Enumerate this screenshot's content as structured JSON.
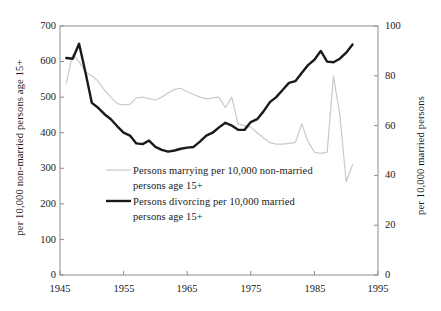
{
  "chart_data": {
    "type": "line",
    "title": "",
    "xlabel": "",
    "ylabel": "per 10,000 non-married persons age 15+",
    "ylabel_right": "per 10,000 married persons",
    "xlim": [
      1945,
      1995
    ],
    "ylim": [
      0,
      700
    ],
    "ylim_right": [
      0,
      100
    ],
    "xticks": [
      1945,
      1955,
      1965,
      1975,
      1985,
      1995
    ],
    "yticks_left": [
      0,
      100,
      200,
      300,
      400,
      500,
      600,
      700
    ],
    "yticks_right": [
      0,
      20,
      40,
      60,
      80,
      100
    ],
    "grid": false,
    "legend_position": "inside-center-left",
    "series": [
      {
        "name": "Persons marrying per 10,000 non-married persons age 15+",
        "axis": "left",
        "color": "#c9c9c9",
        "width": 1.2,
        "x": [
          1946,
          1947,
          1948,
          1949,
          1950,
          1951,
          1952,
          1953,
          1954,
          1955,
          1956,
          1957,
          1958,
          1959,
          1960,
          1961,
          1962,
          1963,
          1964,
          1965,
          1966,
          1967,
          1968,
          1969,
          1970,
          1971,
          1972,
          1973,
          1974,
          1975,
          1976,
          1977,
          1978,
          1979,
          1980,
          1981,
          1982,
          1983,
          1984,
          1985,
          1986,
          1987,
          1988,
          1989,
          1990,
          1991
        ],
        "values": [
          540,
          620,
          600,
          570,
          560,
          545,
          520,
          500,
          482,
          478,
          480,
          498,
          500,
          496,
          492,
          500,
          512,
          522,
          525,
          515,
          508,
          500,
          495,
          498,
          500,
          470,
          500,
          425,
          420,
          415,
          400,
          385,
          372,
          368,
          368,
          370,
          372,
          425,
          375,
          345,
          342,
          345,
          560,
          450,
          262,
          310
        ]
      },
      {
        "name": "Persons divorcing per 10,000 married persons age 15+",
        "axis": "left",
        "color": "#1a1a1a",
        "width": 2.4,
        "x": [
          1946,
          1947,
          1948,
          1949,
          1950,
          1951,
          1952,
          1953,
          1954,
          1955,
          1956,
          1957,
          1958,
          1959,
          1960,
          1961,
          1962,
          1963,
          1964,
          1965,
          1966,
          1967,
          1968,
          1969,
          1970,
          1971,
          1972,
          1973,
          1974,
          1975,
          1976,
          1977,
          1978,
          1979,
          1980,
          1981,
          1982,
          1983,
          1984,
          1985,
          1986,
          1987,
          1988,
          1989,
          1990,
          1991
        ],
        "values": [
          610,
          608,
          650,
          570,
          484,
          470,
          452,
          438,
          418,
          400,
          392,
          370,
          368,
          378,
          360,
          352,
          347,
          350,
          355,
          358,
          360,
          375,
          392,
          400,
          415,
          428,
          420,
          408,
          408,
          430,
          438,
          460,
          486,
          500,
          520,
          540,
          545,
          568,
          590,
          605,
          630,
          600,
          598,
          608,
          625,
          648
        ]
      }
    ],
    "annotations": []
  },
  "legend": {
    "items": [
      {
        "line1": "Persons marrying per 10,000 non-married",
        "line2": "persons age 15+",
        "color": "#c9c9c9",
        "width": 1.2
      },
      {
        "line1": "Persons divorcing per 10,000 married",
        "line2": "persons age 15+",
        "color": "#1a1a1a",
        "width": 2.4
      }
    ]
  },
  "axes": {
    "left_title": "per 10,000 non-married persons age 15+",
    "right_title": "per 10,000 married persons",
    "left_ticks": [
      "700",
      "600",
      "500",
      "400",
      "300",
      "200",
      "100",
      "0"
    ],
    "right_ticks": [
      "100",
      "80",
      "60",
      "40",
      "20",
      "0"
    ],
    "x_ticks": [
      "1945",
      "1955",
      "1965",
      "1975",
      "1985",
      "1995"
    ]
  },
  "colors": {
    "frame": "#8c8c8c",
    "marrying_line": "#c9c9c9",
    "divorcing_line": "#1a1a1a",
    "text": "#1a1a1a",
    "background": "#ffffff"
  }
}
